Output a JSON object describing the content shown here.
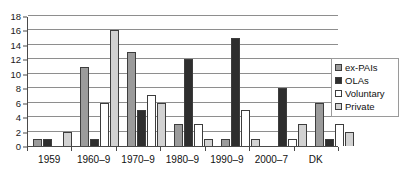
{
  "chart_data": {
    "type": "bar",
    "title": "",
    "subtitle": "",
    "xlabel": "",
    "ylabel": "",
    "ylim": [
      0,
      18
    ],
    "ytick_step": 2,
    "yticks": [
      0,
      2,
      4,
      6,
      8,
      10,
      12,
      14,
      16,
      18
    ],
    "grid": true,
    "grid_axis": "y",
    "legend_position": "right",
    "categories": [
      "1959",
      "1960–9",
      "1970–9",
      "1980–9",
      "1990–9",
      "2000–7",
      "DK"
    ],
    "series": [
      {
        "name": "ex-PAIs",
        "color": "#9b9b9b",
        "values": [
          1,
          11,
          13,
          3,
          1,
          0,
          6
        ]
      },
      {
        "name": "OLAs",
        "color": "#2e2e2e",
        "values": [
          1,
          1,
          5,
          12,
          15,
          8,
          1
        ]
      },
      {
        "name": "Voluntary",
        "color": "#ffffff",
        "values": [
          0,
          6,
          7,
          3,
          5,
          1,
          3
        ]
      },
      {
        "name": "Private",
        "color": "#d2d2d2",
        "values": [
          2,
          16,
          6,
          1,
          1,
          3,
          2
        ]
      }
    ]
  },
  "legend": {
    "items": [
      {
        "label": "ex-PAIs"
      },
      {
        "label": "OLAs"
      },
      {
        "label": "Voluntary"
      },
      {
        "label": "Private"
      }
    ]
  },
  "axes": {
    "y_tick_labels": [
      "18",
      "16",
      "14",
      "12",
      "10",
      "8",
      "6",
      "4",
      "2",
      "0"
    ],
    "x_tick_labels": [
      "1959",
      "1960–9",
      "1970–9",
      "1980–9",
      "1990–9",
      "2000–7",
      "DK"
    ]
  }
}
